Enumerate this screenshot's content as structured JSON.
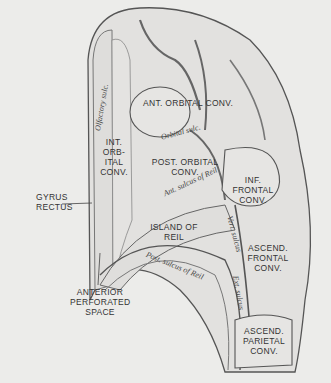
{
  "figure": {
    "labels": {
      "ant_orbital": "ANT. ORBITAL CONV.",
      "int_orbital": "INT. ORB- ITAL CONV.",
      "post_orbital": "POST. ORBITAL CONV.",
      "inf_frontal": "INF. FRONTAL CONV.",
      "island": "ISLAND OF REIL",
      "ascend_frontal": "ASCEND. FRONTAL CONV.",
      "ascend_parietal": "ASCEND. PARIETAL CONV.",
      "gyrus_rectus": "GYRUS RECTUS",
      "ant_perforated": "ANTERIOR PERFORATED SPACE"
    },
    "sulci": {
      "olfactory": "Olfactory sulc.",
      "orbital": "Orbital sulc.",
      "ant_sulcus_reil": "Ant. sulcus of Reil",
      "post_sulcus_reil": "Post. sulcus of Reil",
      "vert_sulcus": "Vert. sulcus",
      "ext_sulcus": "Ext. sulcus"
    }
  }
}
